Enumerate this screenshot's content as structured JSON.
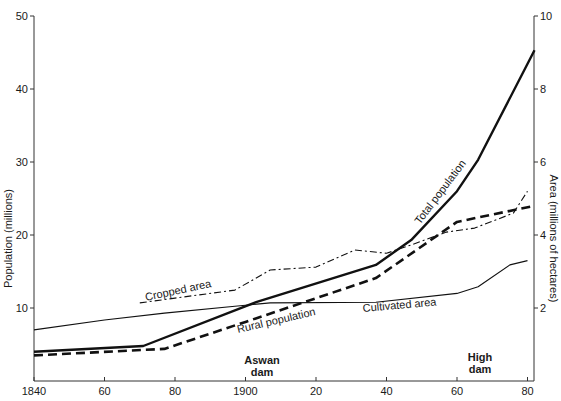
{
  "chart_data": {
    "type": "line",
    "title": "",
    "xlabel": "",
    "ylabel_left": "Population (millions)",
    "ylabel_right": "Area (millions of hectares)",
    "x_ticks": [
      "1840",
      "60",
      "80",
      "1900",
      "20",
      "40",
      "60",
      "80"
    ],
    "x_tick_values": [
      1840,
      1860,
      1880,
      1900,
      1920,
      1940,
      1960,
      1980
    ],
    "xlim": [
      1840,
      1982
    ],
    "ylim_left": [
      0,
      50
    ],
    "y_ticks_left": [
      10,
      20,
      30,
      40,
      50
    ],
    "ylim_right": [
      0,
      10
    ],
    "y_ticks_right": [
      2,
      4,
      6,
      8,
      10
    ],
    "grid": false,
    "legend": "inline labels",
    "annotations": [
      {
        "text_lines": [
          "Aswan",
          "dam"
        ],
        "x": 1902
      },
      {
        "text_lines": [
          "High",
          "dam"
        ],
        "x": 1964
      }
    ],
    "series": [
      {
        "name": "Total population",
        "axis": "left",
        "style": "thick-solid",
        "points": [
          [
            1840,
            4.0
          ],
          [
            1871,
            4.8
          ],
          [
            1903,
            10.8
          ],
          [
            1937,
            15.9
          ],
          [
            1947,
            19.3
          ],
          [
            1960,
            26.0
          ],
          [
            1966,
            30.3
          ],
          [
            1982,
            45.3
          ]
        ]
      },
      {
        "name": "Rural population",
        "axis": "left",
        "style": "thick-dashed",
        "points": [
          [
            1840,
            3.5
          ],
          [
            1877,
            4.4
          ],
          [
            1900,
            8.1
          ],
          [
            1937,
            14.1
          ],
          [
            1960,
            21.8
          ],
          [
            1982,
            24.0
          ]
        ]
      },
      {
        "name": "Cultivated area",
        "axis": "right",
        "style": "thin-solid",
        "points": [
          [
            1840,
            1.4
          ],
          [
            1860,
            1.67
          ],
          [
            1877,
            1.86
          ],
          [
            1897,
            2.05
          ],
          [
            1907,
            2.14
          ],
          [
            1937,
            2.16
          ],
          [
            1960,
            2.4
          ],
          [
            1966,
            2.58
          ],
          [
            1975,
            3.18
          ],
          [
            1980,
            3.3
          ]
        ]
      },
      {
        "name": "Cropped area",
        "axis": "right",
        "style": "dash-dot",
        "points": [
          [
            1870,
            2.14
          ],
          [
            1880,
            2.27
          ],
          [
            1897,
            2.49
          ],
          [
            1907,
            3.04
          ],
          [
            1920,
            3.12
          ],
          [
            1931,
            3.59
          ],
          [
            1940,
            3.5
          ],
          [
            1947,
            3.73
          ],
          [
            1957,
            4.08
          ],
          [
            1965,
            4.19
          ],
          [
            1976,
            4.6
          ],
          [
            1980,
            5.2
          ]
        ]
      }
    ]
  },
  "labels": {
    "total_population": "Total population",
    "rural_population": "Rural population",
    "cultivated_area": "Cultivated area",
    "cropped_area": "Cropped area",
    "aswan_1": "Aswan",
    "aswan_2": "dam",
    "high_1": "High",
    "high_2": "dam"
  }
}
